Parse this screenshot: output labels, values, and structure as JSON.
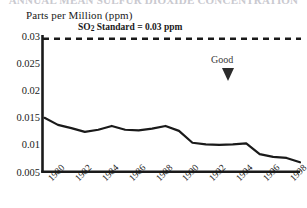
{
  "title_cut_off": "ANNUAL MEAN SULFUR DIOXIDE CONCENTRATION",
  "axis": {
    "y_axis_title": "Parts per Million (ppm)",
    "y_ticks": [
      "0.03",
      "0.025",
      "0.02",
      "0.015",
      "0.01",
      "0.005"
    ],
    "x_ticks": [
      "1980",
      "1982",
      "1984",
      "1986",
      "1988",
      "1990",
      "1992",
      "1994",
      "1996",
      "1998"
    ]
  },
  "annotations": {
    "standard_prefix": "SO",
    "standard_sub": "2",
    "standard_suffix": " Standard = 0.03 ppm",
    "standard_full": "SO2 Standard = 0.03 ppm",
    "good_label": "Good"
  },
  "colors": {
    "line": "#1a1a1a",
    "axis": "#1a1a1a",
    "standard_line": "#1a1a1a",
    "background": "#ffffff",
    "good_arrow": "#2b2b2b"
  },
  "chart_data": {
    "type": "line",
    "title": "ANNUAL MEAN SULFUR DIOXIDE CONCENTRATION",
    "xlabel": "",
    "ylabel": "Parts per Million (ppm)",
    "ylim": [
      0.005,
      0.03
    ],
    "xlim": [
      1979,
      1998
    ],
    "grid": false,
    "legend": "none",
    "x": [
      1979,
      1980,
      1981,
      1982,
      1983,
      1984,
      1985,
      1986,
      1987,
      1988,
      1989,
      1990,
      1991,
      1992,
      1993,
      1994,
      1995,
      1996,
      1997,
      1998
    ],
    "series": [
      {
        "name": "SO2 annual mean",
        "values": [
          0.0149,
          0.0136,
          0.013,
          0.0123,
          0.0127,
          0.0134,
          0.0127,
          0.0126,
          0.0129,
          0.0134,
          0.0125,
          0.0103,
          0.01,
          0.0099,
          0.01,
          0.0102,
          0.0082,
          0.0077,
          0.0075,
          0.0067
        ]
      }
    ],
    "reference_lines": [
      {
        "label": "SO2 Standard = 0.03 ppm",
        "value": 0.0295,
        "style": "dashed",
        "orientation": "horizontal"
      }
    ],
    "annotations": [
      {
        "text": "Good",
        "x": 1994.2,
        "y": 0.0252,
        "arrow": "down"
      }
    ]
  }
}
